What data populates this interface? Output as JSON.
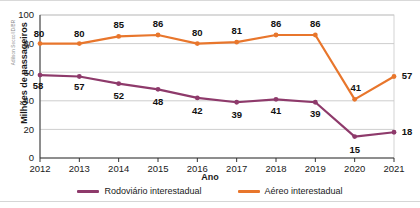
{
  "credit": "Adilson Secco/ID/BR",
  "axes": {
    "y_title": "Milhões de passageiros",
    "x_title": "Ano",
    "y_ticks": [
      "0",
      "20",
      "40",
      "60",
      "80",
      "100"
    ],
    "x_ticks": [
      "2012",
      "2013",
      "2014",
      "2015",
      "2016",
      "2017",
      "2018",
      "2019",
      "2020",
      "2021"
    ]
  },
  "legend": {
    "items": [
      {
        "label": "Rodoviário interestadual",
        "color": "#8E3A6B"
      },
      {
        "label": "Aéreo interestadual",
        "color": "#E8762C"
      }
    ]
  },
  "chart_data": {
    "type": "line",
    "title": "",
    "xlabel": "Ano",
    "ylabel": "Milhões de passageiros",
    "x": [
      2012,
      2013,
      2014,
      2015,
      2016,
      2017,
      2018,
      2019,
      2020,
      2021
    ],
    "categories": [
      "2012",
      "2013",
      "2014",
      "2015",
      "2016",
      "2017",
      "2018",
      "2019",
      "2020",
      "2021"
    ],
    "ylim": [
      0,
      100
    ],
    "yticks": [
      0,
      20,
      40,
      60,
      80,
      100
    ],
    "grid": true,
    "legend_position": "bottom",
    "series": [
      {
        "name": "Rodoviário interestadual",
        "color": "#8E3A6B",
        "values": [
          58,
          57,
          52,
          48,
          42,
          39,
          41,
          39,
          15,
          18
        ],
        "labels": [
          "58",
          "57",
          "52",
          "48",
          "42",
          "39",
          "41",
          "39",
          "15",
          "18"
        ]
      },
      {
        "name": "Aéreo interestadual",
        "color": "#E8762C",
        "values": [
          80,
          80,
          85,
          86,
          80,
          81,
          86,
          86,
          41,
          57
        ],
        "labels": [
          "80",
          "80",
          "85",
          "86",
          "80",
          "81",
          "86",
          "86",
          "41",
          "57"
        ]
      }
    ]
  }
}
